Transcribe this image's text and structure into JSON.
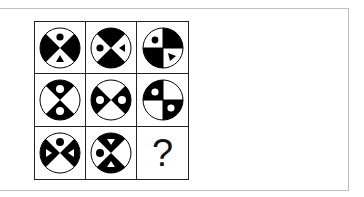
{
  "puzzle": {
    "colors": {
      "fill": "#000000",
      "background": "#ffffff",
      "grid_line": "#222222",
      "frame_line": "#bdbdbd"
    },
    "cells": [
      {
        "row": 1,
        "col": 1,
        "type": "x-sectors",
        "black": [
          "left",
          "right"
        ],
        "symbols": [
          {
            "sector": "top",
            "shape": "dot",
            "color": "black"
          },
          {
            "sector": "bottom",
            "shape": "triangle-up",
            "color": "black"
          }
        ]
      },
      {
        "row": 1,
        "col": 2,
        "type": "x-sectors",
        "black": [
          "top",
          "bottom"
        ],
        "symbols": [
          {
            "sector": "left",
            "shape": "dot",
            "color": "black"
          },
          {
            "sector": "right",
            "shape": "triangle-left",
            "color": "black"
          }
        ]
      },
      {
        "row": 1,
        "col": 3,
        "type": "quadrants",
        "black": [
          "top-right",
          "bottom-left"
        ],
        "symbols": [
          {
            "sector": "top-left",
            "shape": "dot",
            "color": "black"
          },
          {
            "sector": "bottom-right",
            "shape": "triangle-down-right",
            "color": "black"
          }
        ]
      },
      {
        "row": 2,
        "col": 1,
        "type": "x-sectors",
        "black": [
          "top",
          "bottom"
        ],
        "symbols": [
          {
            "sector": "top",
            "shape": "dot",
            "color": "white"
          },
          {
            "sector": "bottom",
            "shape": "dot",
            "color": "white"
          }
        ]
      },
      {
        "row": 2,
        "col": 2,
        "type": "x-sectors",
        "black": [
          "left",
          "right"
        ],
        "symbols": [
          {
            "sector": "left",
            "shape": "dot",
            "color": "white"
          },
          {
            "sector": "right",
            "shape": "dot",
            "color": "white"
          }
        ]
      },
      {
        "row": 2,
        "col": 3,
        "type": "quadrants",
        "black": [
          "top-left",
          "bottom-right"
        ],
        "symbols": [
          {
            "sector": "top-left",
            "shape": "dot",
            "color": "white"
          },
          {
            "sector": "bottom-right",
            "shape": "dot",
            "color": "white"
          }
        ]
      },
      {
        "row": 3,
        "col": 1,
        "type": "x-sectors",
        "black": [
          "left",
          "right"
        ],
        "symbols": [
          {
            "sector": "top",
            "shape": "dot",
            "color": "black"
          },
          {
            "sector": "left",
            "shape": "triangle-right",
            "color": "white"
          },
          {
            "sector": "right",
            "shape": "triangle-left",
            "color": "white"
          }
        ]
      },
      {
        "row": 3,
        "col": 2,
        "type": "x-sectors",
        "black": [
          "top",
          "bottom"
        ],
        "symbols": [
          {
            "sector": "top",
            "shape": "triangle-down",
            "color": "white"
          },
          {
            "sector": "left",
            "shape": "dot",
            "color": "black"
          },
          {
            "sector": "bottom",
            "shape": "triangle-up",
            "color": "white"
          }
        ]
      },
      {
        "row": 3,
        "col": 3,
        "type": "question",
        "label": "?"
      }
    ]
  }
}
